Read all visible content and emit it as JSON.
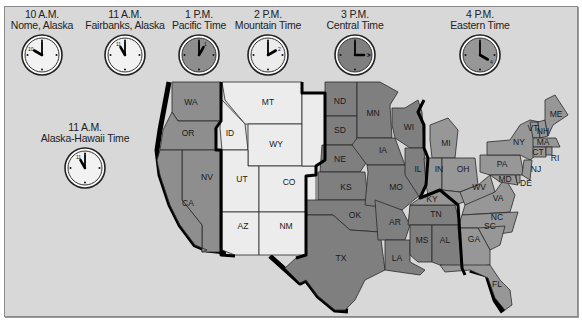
{
  "clocks": [
    {
      "id": "nome",
      "time": "10 A.M.",
      "zone": "Nome, Alaska",
      "hour": 10,
      "face": "#f2f2f2",
      "numeral": "10"
    },
    {
      "id": "fairbanks",
      "time": "11 A.M.",
      "zone": "Fairbanks, Alaska",
      "hour": 11,
      "face": "#f2f2f2",
      "numeral": "11"
    },
    {
      "id": "pacific",
      "time": "1 P.M.",
      "zone": "Pacific Time",
      "hour": 1,
      "face": "#8e8e8e",
      "numeral": "1"
    },
    {
      "id": "mountain",
      "time": "2 P.M.",
      "zone": "Mountain Time",
      "hour": 2,
      "face": "#ececec",
      "numeral": "2"
    },
    {
      "id": "central",
      "time": "3 P.M.",
      "zone": "Central Time",
      "hour": 3,
      "face": "#7f7f7f",
      "numeral": "3"
    },
    {
      "id": "eastern",
      "time": "4 P.M.",
      "zone": "Eastern Time",
      "hour": 4,
      "face": "#979797",
      "numeral": "4"
    },
    {
      "id": "alaska-hawaii",
      "time": "11 A.M.",
      "zone": "Alaska-Hawaii Time",
      "hour": 11,
      "face": "#f2f2f2",
      "numeral": "11"
    }
  ],
  "zone_colors": {
    "pacific": "#8e8e8e",
    "mountain": "#ececec",
    "central": "#7f7f7f",
    "eastern": "#979797",
    "background": "#d8d8d8"
  },
  "states": {
    "pacific": [
      "WA",
      "OR",
      "CA",
      "NV"
    ],
    "mountain": [
      "MT",
      "ID",
      "WY",
      "UT",
      "CO",
      "AZ",
      "NM"
    ],
    "central": [
      "ND",
      "SD",
      "NE",
      "KS",
      "OK",
      "TX",
      "MN",
      "IA",
      "MO",
      "AR",
      "LA",
      "WI",
      "IL",
      "MS",
      "AL",
      "TN"
    ],
    "eastern": [
      "MI",
      "IN",
      "OH",
      "KY",
      "WV",
      "VA",
      "NC",
      "SC",
      "GA",
      "FL",
      "PA",
      "NY",
      "VT",
      "NH",
      "ME",
      "MA",
      "CT",
      "RI",
      "NJ",
      "DE",
      "MD"
    ]
  },
  "labels": {
    "WA": "WA",
    "OR": "OR",
    "CA": "CA",
    "NV": "NV",
    "ID": "ID",
    "MT": "MT",
    "WY": "WY",
    "UT": "UT",
    "CO": "CO",
    "AZ": "AZ",
    "NM": "NM",
    "ND": "ND",
    "SD": "SD",
    "NE": "NE",
    "KS": "KS",
    "OK": "OK",
    "TX": "TX",
    "MN": "MN",
    "IA": "IA",
    "MO": "MO",
    "AR": "AR",
    "LA": "LA",
    "WI": "WI",
    "IL": "IL",
    "MS": "MS",
    "AL": "AL",
    "TN": "TN",
    "KY": "KY",
    "MI": "MI",
    "IN": "IN",
    "OH": "OH",
    "WV": "WV",
    "VA": "VA",
    "NC": "NC",
    "SC": "SC",
    "GA": "GA",
    "FL": "FL",
    "PA": "PA",
    "NY": "NY",
    "VT": "VT",
    "NH": "NH",
    "ME": "ME",
    "MA": "MA",
    "CT": "CT",
    "RI": "RI",
    "NJ": "NJ",
    "DE": "DE",
    "MD": "MD"
  }
}
